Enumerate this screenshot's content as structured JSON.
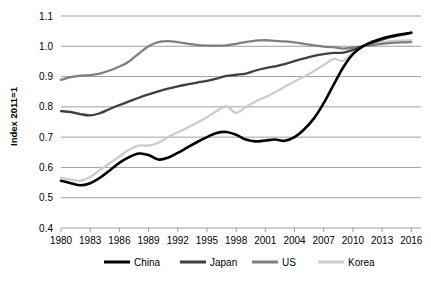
{
  "chart_data": {
    "type": "line",
    "title": "",
    "xlabel": "",
    "ylabel": "Index 2011=1",
    "xlim": [
      1980,
      2017
    ],
    "ylim": [
      0.4,
      1.1
    ],
    "ytick_labels": [
      "1.1",
      "1.0",
      "0.9",
      "0.8",
      "0.7",
      "0.6",
      "0.5",
      "0.4"
    ],
    "ytick_values": [
      1.1,
      1.0,
      0.9,
      0.8,
      0.7,
      0.6,
      0.5,
      0.4
    ],
    "xtick_labels": [
      "1980",
      "1983",
      "1986",
      "1989",
      "1992",
      "1995",
      "1998",
      "2001",
      "2004",
      "2007",
      "2010",
      "2013",
      "2016"
    ],
    "xtick_values": [
      1980,
      1983,
      1986,
      1989,
      1992,
      1995,
      1998,
      2001,
      2004,
      2007,
      2010,
      2013,
      2016
    ],
    "grid": true,
    "legend_position": "bottom",
    "x": [
      1980,
      1981,
      1982,
      1983,
      1984,
      1985,
      1986,
      1987,
      1988,
      1989,
      1990,
      1991,
      1992,
      1993,
      1994,
      1995,
      1996,
      1997,
      1998,
      1999,
      2000,
      2001,
      2002,
      2003,
      2004,
      2005,
      2006,
      2007,
      2008,
      2009,
      2010,
      2011,
      2012,
      2013,
      2014,
      2015,
      2016
    ],
    "series": [
      {
        "name": "China",
        "color": "#000000",
        "values": [
          0.556,
          0.548,
          0.541,
          0.548,
          0.566,
          0.59,
          0.615,
          0.634,
          0.646,
          0.641,
          0.626,
          0.632,
          0.648,
          0.666,
          0.684,
          0.7,
          0.714,
          0.717,
          0.708,
          0.692,
          0.686,
          0.689,
          0.692,
          0.688,
          0.7,
          0.726,
          0.762,
          0.812,
          0.872,
          0.93,
          0.974,
          1.0,
          1.015,
          1.026,
          1.034,
          1.04,
          1.045
        ]
      },
      {
        "name": "Japan",
        "color": "#3f3f3f",
        "values": [
          0.786,
          0.783,
          0.776,
          0.772,
          0.779,
          0.793,
          0.806,
          0.818,
          0.83,
          0.841,
          0.851,
          0.86,
          0.868,
          0.874,
          0.88,
          0.886,
          0.893,
          0.902,
          0.906,
          0.91,
          0.92,
          0.928,
          0.934,
          0.941,
          0.951,
          0.96,
          0.968,
          0.974,
          0.978,
          0.979,
          0.988,
          1.0,
          1.012,
          1.022,
          1.031,
          1.038,
          1.044
        ]
      },
      {
        "name": "US",
        "color": "#7f7f7f",
        "values": [
          0.889,
          0.898,
          0.903,
          0.905,
          0.91,
          0.92,
          0.933,
          0.95,
          0.976,
          1.0,
          1.014,
          1.017,
          1.014,
          1.009,
          1.004,
          1.002,
          1.002,
          1.003,
          1.008,
          1.014,
          1.019,
          1.02,
          1.018,
          1.016,
          1.013,
          1.008,
          1.003,
          0.999,
          0.997,
          0.992,
          0.996,
          1.0,
          1.004,
          1.008,
          1.011,
          1.013,
          1.014
        ]
      },
      {
        "name": "Korea",
        "color": "#cccccc",
        "values": [
          0.566,
          0.56,
          0.556,
          0.568,
          0.592,
          0.614,
          0.636,
          0.658,
          0.672,
          0.672,
          0.682,
          0.7,
          0.716,
          0.731,
          0.748,
          0.766,
          0.786,
          0.802,
          0.78,
          0.8,
          0.818,
          0.832,
          0.848,
          0.866,
          0.884,
          0.9,
          0.918,
          0.938,
          0.958,
          0.952,
          0.978,
          1.0,
          1.008,
          1.013,
          1.017,
          1.019,
          1.02
        ]
      }
    ],
    "legend": [
      {
        "label": "China",
        "color": "#000000"
      },
      {
        "label": "Japan",
        "color": "#3f3f3f"
      },
      {
        "label": "US",
        "color": "#7f7f7f"
      },
      {
        "label": "Korea",
        "color": "#cccccc"
      }
    ]
  }
}
